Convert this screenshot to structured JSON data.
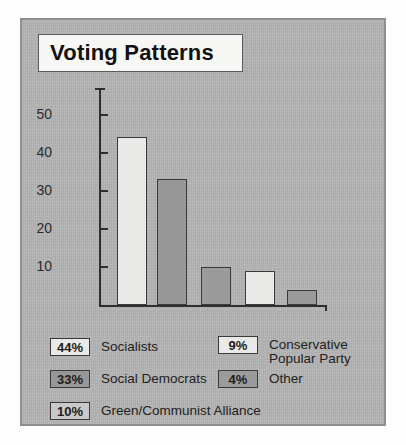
{
  "figure": {
    "title": "Voting Patterns",
    "panel_color": "#b4b4b4",
    "panel_border_color": "#8e8e8e",
    "title_box_color": "#f7f7f5"
  },
  "chart_data": {
    "type": "bar",
    "title": "Voting Patterns",
    "xlabel": "",
    "ylabel": "",
    "ylim": [
      0,
      57
    ],
    "grid": false,
    "legend_position": "below",
    "yticks": [
      10,
      20,
      30,
      40,
      50
    ],
    "ytick_labels": [
      "10",
      "20",
      "30",
      "40",
      "50"
    ],
    "categories": [
      "Socialists",
      "Social Democrats",
      "Green/Communist Alliance",
      "Conservative Popular Party",
      "Other"
    ],
    "values": [
      44,
      33,
      10,
      9,
      4
    ],
    "bar_colors": [
      "#e9e9e7",
      "#979797",
      "#9b9b9b",
      "#e9e9e7",
      "#9b9b9b"
    ],
    "bar_edge_color": "#3a3a3a",
    "data_labels": [
      "44%",
      "33%",
      "10%",
      "9%",
      "4%"
    ]
  },
  "axis": {
    "ticks": [
      {
        "label": "50",
        "value": 50
      },
      {
        "label": "40",
        "value": 40
      },
      {
        "label": "30",
        "value": 30
      },
      {
        "label": "20",
        "value": 20
      },
      {
        "label": "10",
        "value": 10
      }
    ]
  },
  "bars": [
    {
      "name": "socialists",
      "value": 44,
      "label": "44%",
      "color": "#e9e9e7"
    },
    {
      "name": "social-democrats",
      "value": 33,
      "label": "33%",
      "color": "#979797"
    },
    {
      "name": "green-communist",
      "value": 10,
      "label": "10%",
      "color": "#9b9b9b"
    },
    {
      "name": "conservative",
      "value": 9,
      "label": "9%",
      "color": "#e9e9e7"
    },
    {
      "name": "other",
      "value": 4,
      "label": "4%",
      "color": "#9b9b9b"
    }
  ],
  "legend": {
    "column_left": [
      {
        "percent": "44%",
        "label": "Socialists",
        "color": "#e9e9e7"
      },
      {
        "percent": "33%",
        "label": "Social Democrats",
        "color": "#979797"
      },
      {
        "percent": "10%",
        "label": "Green/Communist Alliance",
        "color": "#c9c9c9"
      }
    ],
    "column_right": [
      {
        "percent": "9%",
        "label": "Conservative\nPopular Party",
        "color": "#e9e9e7"
      },
      {
        "percent": "4%",
        "label": "Other",
        "color": "#9b9b9b"
      }
    ]
  }
}
